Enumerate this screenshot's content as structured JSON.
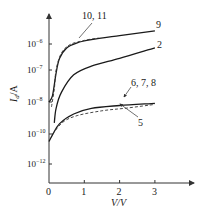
{
  "chart_data": {
    "type": "line",
    "title": "",
    "xlabel": "V/V",
    "ylabel": "I_d/A",
    "yscale": "log",
    "xlim": [
      0,
      3.5
    ],
    "x_ticks": [
      {
        "value": 0,
        "label": "0"
      },
      {
        "value": 1,
        "label": "1"
      },
      {
        "value": 2,
        "label": "2"
      },
      {
        "value": 3,
        "label": "3"
      }
    ],
    "y_ticks": [
      {
        "exp": -6,
        "base": "10",
        "sup": "-6"
      },
      {
        "exp": -7,
        "base": "10",
        "sup": "-7"
      },
      {
        "exp": -8,
        "base": "10",
        "sup": "-8"
      },
      {
        "exp": -10,
        "base": "10",
        "sup": "-10"
      },
      {
        "exp": -12,
        "base": "10",
        "sup": "-12"
      }
    ],
    "grid": false,
    "legend": "inline curve labels",
    "series": [
      {
        "name": "9",
        "style": "solid",
        "points_log10": [
          [
            0,
            -8
          ],
          [
            0.1,
            -7.8
          ],
          [
            0.2,
            -7.1
          ],
          [
            0.3,
            -6.55
          ],
          [
            0.5,
            -6.15
          ],
          [
            0.8,
            -5.95
          ],
          [
            1.2,
            -5.82
          ],
          [
            2,
            -5.65
          ],
          [
            3,
            -5.45
          ]
        ]
      },
      {
        "name": "10, 11",
        "style": "dashed",
        "points_log10": [
          [
            0.07,
            -8.3
          ],
          [
            0.15,
            -7.6
          ],
          [
            0.2,
            -7
          ],
          [
            0.35,
            -6.35
          ],
          [
            0.6,
            -6.02
          ],
          [
            1.0,
            -5.85
          ],
          [
            1.4,
            -5.75
          ]
        ]
      },
      {
        "name": "2",
        "style": "solid",
        "points_log10": [
          [
            0.15,
            -9.3
          ],
          [
            0.2,
            -8.4
          ],
          [
            0.35,
            -7.7
          ],
          [
            0.7,
            -7.15
          ],
          [
            1.2,
            -6.85
          ],
          [
            2,
            -6.55
          ],
          [
            3,
            -6.15
          ]
        ]
      },
      {
        "name": "6, 7, 8",
        "style": "solid",
        "points_log10": [
          [
            0,
            -10.5
          ],
          [
            0.1,
            -10.05
          ],
          [
            0.3,
            -9.35
          ],
          [
            0.7,
            -8.75
          ],
          [
            1.2,
            -8.4
          ],
          [
            2,
            -8.22
          ],
          [
            3,
            -8.08
          ]
        ]
      },
      {
        "name": "5",
        "style": "dashed",
        "points_log10": [
          [
            0.1,
            -10.0
          ],
          [
            0.4,
            -9.25
          ],
          [
            0.8,
            -8.85
          ],
          [
            1.5,
            -8.55
          ],
          [
            2.2,
            -8.38
          ],
          [
            3,
            -8.15
          ]
        ]
      }
    ],
    "annotations": [
      {
        "text": "10, 11",
        "target_series": "10, 11"
      },
      {
        "text": "9",
        "target_series": "9"
      },
      {
        "text": "2",
        "target_series": "2"
      },
      {
        "text": "6, 7, 8",
        "target_series": "6, 7, 8"
      },
      {
        "text": "5",
        "target_series": "5"
      }
    ]
  },
  "labels": {
    "ylabel_main": "I",
    "ylabel_sub": "d",
    "ylabel_unit": "/A",
    "xlabel": "V/V",
    "curve_9": "9",
    "curve_2": "2",
    "curve_10_11": "10, 11",
    "curve_6_7_8": "6, 7, 8",
    "curve_5": "5"
  }
}
